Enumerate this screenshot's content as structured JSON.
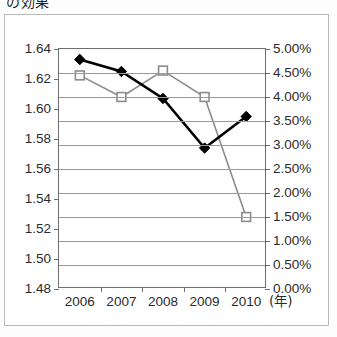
{
  "caption": "の効果",
  "axes": {
    "x_unit_label": "(年)",
    "x_ticks": [
      "2006",
      "2007",
      "2008",
      "2009",
      "2010"
    ],
    "y_left_ticks": [
      "1.64",
      "1.62",
      "1.60",
      "1.58",
      "1.56",
      "1.54",
      "1.52",
      "1.50",
      "1.48"
    ],
    "y_right_ticks": [
      "5.00%",
      "4.50%",
      "4.00%",
      "3.50%",
      "3.00%",
      "2.50%",
      "2.00%",
      "1.50%",
      "1.00%",
      "0.50%",
      "0.00%"
    ]
  },
  "colors": {
    "series_primary": "#000000",
    "series_secondary": "#8c8c8c",
    "grid": "#9a9a9a",
    "axis": "#6e6e6e",
    "frame": "#b9b9b9",
    "text": "#2b2b2b"
  },
  "chart_data": {
    "type": "line",
    "title": "の効果",
    "xlabel": "(年)",
    "ylabel": "",
    "x": [
      "2006",
      "2007",
      "2008",
      "2009",
      "2010"
    ],
    "categories": [
      "2006",
      "2007",
      "2008",
      "2009",
      "2010"
    ],
    "grid": true,
    "legend": "none",
    "series": [
      {
        "name": "filled-diamond-series",
        "axis": "left",
        "marker": "filled-diamond",
        "color": "#000000",
        "values": [
          1.633,
          1.625,
          1.607,
          1.574,
          1.595
        ],
        "ylim": [
          1.48,
          1.64
        ],
        "ytick_step": 0.02
      },
      {
        "name": "open-square-series",
        "axis": "right",
        "marker": "open-square",
        "color": "#8c8c8c",
        "values": [
          4.45,
          4.0,
          4.55,
          4.0,
          1.5
        ],
        "ylim": [
          0.0,
          5.0
        ],
        "ytick_step": 0.5,
        "unit": "%"
      }
    ]
  }
}
